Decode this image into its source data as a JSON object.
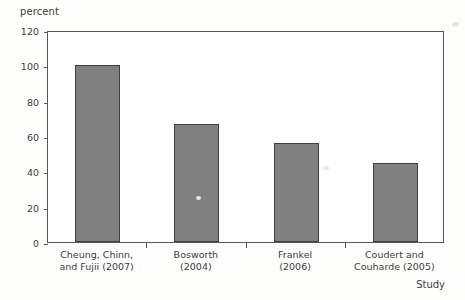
{
  "chart_data": {
    "type": "bar",
    "title": "",
    "subtitle": "",
    "xlabel": "Study",
    "ylabel": "percent",
    "ylim": [
      0,
      120
    ],
    "ytick_values": [
      0,
      20,
      40,
      60,
      80,
      100,
      120
    ],
    "ytick_labels": [
      "0",
      "20",
      "40",
      "60",
      "80",
      "100",
      "120"
    ],
    "grid": false,
    "legend": null,
    "bar_color": "#808080",
    "bar_edge_color": "#3f3f3f",
    "axis_color": "#55595a",
    "categories": [
      "Cheung, Chinn, and Fujii (2007)",
      "Bosworth (2004)",
      "Frankel (2006)",
      "Coudert and Couharde (2005)"
    ],
    "category_lines": [
      [
        "Cheung, Chinn,",
        "and Fujii (2007)"
      ],
      [
        "Bosworth",
        "(2004)"
      ],
      [
        "Frankel",
        "(2006)"
      ],
      [
        "Coudert and",
        "Couharde (2005)"
      ]
    ],
    "values": [
      100,
      67,
      56,
      45
    ]
  }
}
